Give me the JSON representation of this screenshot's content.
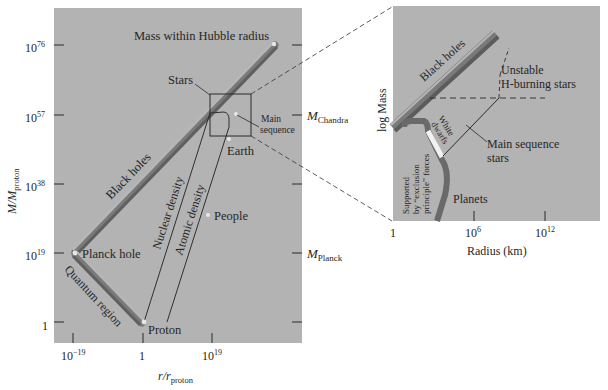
{
  "colors": {
    "panel": "#b3b3b3",
    "background": "#ffffff",
    "ink": "#262626",
    "band_dark": "#6e6e6e",
    "band_light": "#d2d2d2"
  },
  "left_panel": {
    "y_axis_label_main": "M/M",
    "y_axis_label_sub": "proton",
    "x_axis_label_main": "r/r",
    "x_axis_label_sub": "proton",
    "y_ticks": [
      {
        "base": "10",
        "exp": "76"
      },
      {
        "base": "10",
        "exp": "57"
      },
      {
        "base": "10",
        "exp": "38"
      },
      {
        "base": "10",
        "exp": "19"
      },
      {
        "base": "1",
        "exp": ""
      }
    ],
    "x_ticks": [
      {
        "base": "10",
        "exp": "−19"
      },
      {
        "base": "1",
        "exp": ""
      },
      {
        "base": "10",
        "exp": "19"
      }
    ],
    "right_ticks": {
      "chandra_main": "M",
      "chandra_sub": "Chandra",
      "planck_main": "M",
      "planck_sub": "Planck"
    },
    "labels": {
      "hubble": "Mass within Hubble radius",
      "stars": "Stars",
      "main_sequence_1": "Main",
      "main_sequence_2": "sequence",
      "earth": "Earth",
      "black_holes": "Black holes",
      "nuclear_density": "Nuclear density",
      "atomic_density": "Atomic density",
      "people": "People",
      "planck_hole": "Planck hole",
      "quantum_region": "Quantum region",
      "proton": "Proton"
    }
  },
  "right_panel": {
    "y_axis_label": "log Mass",
    "x_axis_label": "Radius (km)",
    "x_ticks": [
      {
        "base": "1",
        "exp": ""
      },
      {
        "base": "10",
        "exp": "6"
      },
      {
        "base": "10",
        "exp": "12"
      }
    ],
    "labels": {
      "black_holes": "Black holes",
      "unstable_1": "Unstable",
      "unstable_2": "H-burning stars",
      "white_dwarfs_1": "White",
      "white_dwarfs_2": "dwarfs",
      "main_seq_1": "Main sequence",
      "main_seq_2": "stars",
      "supported_1": "Supported",
      "supported_2": "by “exclusion",
      "supported_3": "principle” forces",
      "planets": "Planets"
    }
  }
}
